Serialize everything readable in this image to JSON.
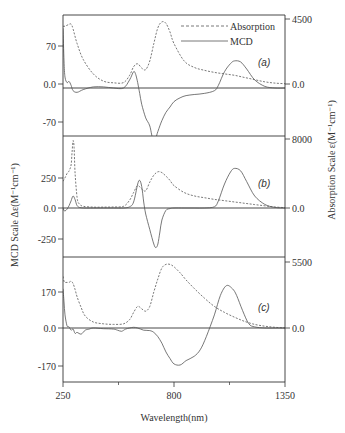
{
  "chart_data": {
    "type": "line",
    "xlabel": "Wavelength(nm)",
    "ylabel_left": "MCD Scale Δε(M⁻¹cm⁻¹)",
    "ylabel_right": "Absorption Scale ε(M⁻¹cm⁻¹)",
    "xlim": [
      250,
      1350
    ],
    "x_ticks": [
      "250",
      "800",
      "1350"
    ],
    "legend": [
      {
        "name": "Absorption",
        "style": "dashed"
      },
      {
        "name": "MCD",
        "style": "solid"
      }
    ],
    "legend_position": "top-right",
    "grid": false,
    "panels": [
      {
        "label": "(a)",
        "mcd_ticks": [
          "70",
          "0.0",
          "-70"
        ],
        "abs_ticks": [
          "4500",
          "0.0"
        ],
        "mcd_range": [
          -100,
          100
        ],
        "abs_range": [
          0,
          4500
        ],
        "series": [
          {
            "name": "Absorption",
            "x": [
              250,
              260,
              275,
              290,
              300,
              320,
              350,
              400,
              450,
              500,
              550,
              580,
              600,
              620,
              640,
              660,
              680,
              700,
              720,
              740,
              760,
              780,
              800,
              850,
              900,
              950,
              1000,
              1050,
              1100,
              1150,
              1200,
              1250,
              1300,
              1350
            ],
            "values": [
              4000,
              4000,
              4100,
              4150,
              3800,
              2800,
              1700,
              700,
              200,
              80,
              100,
              600,
              1200,
              1400,
              1100,
              1000,
              1600,
              2800,
              3900,
              4300,
              4200,
              3600,
              2800,
              1600,
              1150,
              950,
              800,
              700,
              600,
              450,
              300,
              150,
              60,
              20
            ]
          },
          {
            "name": "MCD",
            "x": [
              250,
              255,
              260,
              270,
              280,
              290,
              300,
              320,
              350,
              400,
              450,
              500,
              550,
              580,
              600,
              610,
              620,
              630,
              640,
              660,
              680,
              700,
              720,
              740,
              760,
              780,
              800,
              830,
              860,
              900,
              950,
              1000,
              1020,
              1050,
              1080,
              1100,
              1130,
              1160,
              1200,
              1250,
              1300,
              1350
            ],
            "values": [
              110,
              50,
              20,
              10,
              12,
              5,
              -5,
              -8,
              -3,
              2,
              2,
              0,
              0,
              15,
              30,
              25,
              10,
              -10,
              -30,
              -55,
              -70,
              -100,
              -80,
              -60,
              -45,
              -35,
              -25,
              -18,
              -14,
              -12,
              -10,
              -5,
              5,
              30,
              45,
              50,
              48,
              35,
              15,
              3,
              0,
              0
            ]
          }
        ]
      },
      {
        "label": "(b)",
        "mcd_ticks": [
          "250",
          "0.0",
          "-250"
        ],
        "abs_ticks": [
          "8000",
          "0.0"
        ],
        "mcd_range": [
          -350,
          400
        ],
        "abs_range": [
          0,
          8000
        ],
        "series": [
          {
            "name": "Absorption",
            "x": [
              250,
              260,
              270,
              280,
              290,
              295,
              300,
              305,
              310,
              320,
              330,
              350,
              400,
              450,
              500,
              550,
              580,
              600,
              620,
              640,
              660,
              680,
              700,
              720,
              740,
              760,
              780,
              800,
              850,
              900,
              950,
              1000,
              1050,
              1100,
              1150,
              1200,
              1250,
              1300,
              1350
            ],
            "values": [
              3100,
              3500,
              4000,
              4300,
              5000,
              6500,
              7800,
              7000,
              4000,
              1200,
              500,
              200,
              100,
              100,
              120,
              200,
              900,
              1800,
              2600,
              2200,
              2000,
              3000,
              3800,
              4200,
              4100,
              3700,
              3200,
              2600,
              1800,
              1400,
              1200,
              1000,
              850,
              700,
              550,
              400,
              250,
              120,
              40
            ]
          },
          {
            "name": "MCD",
            "x": [
              250,
              255,
              260,
              270,
              280,
              290,
              300,
              310,
              320,
              340,
              400,
              450,
              500,
              550,
              580,
              600,
              620,
              630,
              640,
              650,
              660,
              680,
              700,
              710,
              720,
              730,
              740,
              760,
              780,
              800,
              850,
              900,
              950,
              1000,
              1020,
              1050,
              1080,
              1100,
              1130,
              1160,
              1200,
              1250,
              1300,
              1350
            ],
            "values": [
              0,
              -20,
              -25,
              -10,
              20,
              60,
              100,
              70,
              20,
              2,
              0,
              0,
              0,
              0,
              10,
              50,
              200,
              230,
              180,
              50,
              -50,
              -180,
              -300,
              -330,
              -300,
              -200,
              -100,
              -20,
              -5,
              0,
              0,
              0,
              0,
              10,
              60,
              200,
              300,
              330,
              310,
              220,
              100,
              30,
              5,
              0
            ]
          }
        ]
      },
      {
        "label": "(c)",
        "mcd_ticks": [
          "170",
          "0.0",
          "-170"
        ],
        "abs_ticks": [
          "5500",
          "0.0"
        ],
        "mcd_range": [
          -200,
          200
        ],
        "abs_range": [
          0,
          5500
        ],
        "series": [
          {
            "name": "Absorption",
            "x": [
              250,
              255,
              260,
              270,
              280,
              290,
              300,
              310,
              320,
              340,
              360,
              400,
              450,
              500,
              550,
              580,
              600,
              620,
              640,
              660,
              680,
              700,
              720,
              740,
              760,
              780,
              800,
              830,
              860,
              900,
              950,
              1000,
              1050,
              1100,
              1150,
              1200,
              1250,
              1300,
              1350
            ],
            "values": [
              4300,
              3900,
              3800,
              3800,
              3800,
              3900,
              3700,
              3200,
              2600,
              1700,
              1000,
              500,
              350,
              300,
              350,
              700,
              1300,
              1800,
              1600,
              1400,
              1800,
              3000,
              4100,
              5000,
              5300,
              5300,
              5100,
              4600,
              4000,
              3300,
              2500,
              1800,
              1300,
              900,
              550,
              300,
              150,
              60,
              10
            ]
          },
          {
            "name": "MCD",
            "x": [
              250,
              255,
              260,
              270,
              280,
              290,
              300,
              310,
              320,
              340,
              360,
              380,
              400,
              450,
              500,
              520,
              540,
              560,
              580,
              600,
              620,
              650,
              680,
              700,
              720,
              740,
              760,
              780,
              800,
              830,
              860,
              900,
              930,
              960,
              1000,
              1030,
              1060,
              1090,
              1110,
              1140,
              1170,
              1200,
              1250,
              1300,
              1350
            ],
            "values": [
              180,
              120,
              60,
              10,
              5,
              -10,
              -5,
              -25,
              -20,
              -28,
              -10,
              -5,
              0,
              -3,
              -5,
              -10,
              -15,
              -5,
              0,
              3,
              0,
              -10,
              -12,
              -20,
              -40,
              -70,
              -110,
              -140,
              -165,
              -170,
              -150,
              -130,
              -100,
              -40,
              60,
              150,
              195,
              180,
              150,
              80,
              20,
              5,
              0,
              0,
              0
            ]
          }
        ]
      }
    ]
  },
  "axes": {
    "x_title": "Wavelength(nm)",
    "left_title": "MCD Scale Δε(M⁻¹cm⁻¹)",
    "right_title": "Absorption Scale ε(M⁻¹cm⁻¹)"
  },
  "colors": {
    "axis": "#333333",
    "curve": "#555555",
    "background": "#ffffff"
  }
}
